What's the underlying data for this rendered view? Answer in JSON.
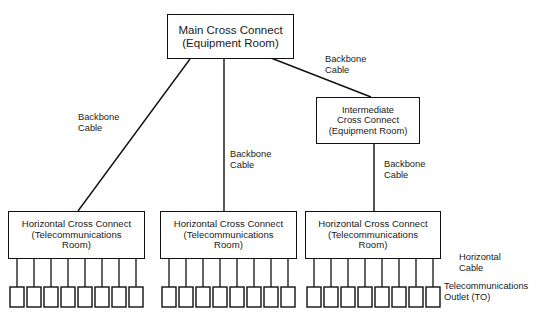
{
  "diagram": {
    "stroke_color": "#111111",
    "background_color": "#ffffff",
    "nodes": {
      "main_cross_connect": {
        "label": "Main Cross Connect\n(Equipment Room)",
        "line1": "Main Cross Connect",
        "line2": "(Equipment Room)"
      },
      "intermediate_cross_connect": {
        "label": "Intermediate\nCross Connect\n(Equipment Room)",
        "line1": "Intermediate",
        "line2": "Cross Connect",
        "line3": "(Equipment Room)"
      },
      "horizontal_cross_connect_1": {
        "label": "Horizontal Cross Connect\n(Telecommunications\nRoom)",
        "line1": "Horizontal Cross Connect",
        "line2": "(Telecommunications",
        "line3": "Room)",
        "outlet_count": 8
      },
      "horizontal_cross_connect_2": {
        "label": "Horizontal Cross Connect\n(Telecommunications\nRoom)",
        "line1": "Horizontal Cross Connect",
        "line2": "(Telecommunications",
        "line3": "Room)",
        "outlet_count": 8
      },
      "horizontal_cross_connect_3": {
        "label": "Horizontal Cross Connect\n(Telecommunications\nRoom)",
        "line1": "Horizontal Cross Connect",
        "line2": "(Telecommunications",
        "line3": "Room)",
        "outlet_count": 8
      }
    },
    "labels": {
      "backbone_cable_left": "Backbone\nCable",
      "backbone_cable_center": "Backbone\nCable",
      "backbone_cable_right_top": "Backbone\nCable",
      "backbone_cable_right_mid": "Backbone\nCable",
      "horizontal_cable": "Horizontal\nCable",
      "telecommunications_outlet": "Telecommunications\nOutlet (TO)"
    }
  }
}
